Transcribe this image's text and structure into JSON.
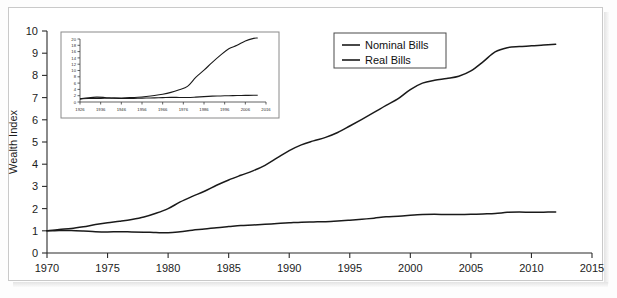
{
  "figure": {
    "background_color": "#ffffff",
    "frame_color": "#c9c9c9",
    "line_color": "#1a1a1a"
  },
  "chart_data": {
    "type": "line",
    "title": "",
    "xlabel": "",
    "ylabel": "Wealth Index",
    "xlim": [
      1970,
      2015
    ],
    "ylim": [
      0,
      10
    ],
    "grid": false,
    "legend_position": "top-right",
    "xticks": [
      1970,
      1975,
      1980,
      1985,
      1990,
      1995,
      2000,
      2005,
      2010,
      2015
    ],
    "yticks": [
      0,
      1,
      2,
      3,
      4,
      5,
      6,
      7,
      8,
      9,
      10
    ],
    "x": [
      1970,
      1971,
      1972,
      1973,
      1974,
      1975,
      1976,
      1977,
      1978,
      1979,
      1980,
      1981,
      1982,
      1983,
      1984,
      1985,
      1986,
      1987,
      1988,
      1989,
      1990,
      1991,
      1992,
      1993,
      1994,
      1995,
      1996,
      1997,
      1998,
      1999,
      2000,
      2001,
      2002,
      2003,
      2004,
      2005,
      2006,
      2007,
      2008,
      2009,
      2010,
      2011,
      2012
    ],
    "series": [
      {
        "name": "Nominal Bills",
        "values": [
          1.0,
          1.06,
          1.1,
          1.18,
          1.28,
          1.36,
          1.43,
          1.51,
          1.62,
          1.79,
          2.0,
          2.3,
          2.55,
          2.78,
          3.05,
          3.29,
          3.5,
          3.7,
          3.95,
          4.28,
          4.61,
          4.87,
          5.05,
          5.21,
          5.43,
          5.72,
          6.02,
          6.33,
          6.65,
          6.95,
          7.36,
          7.65,
          7.78,
          7.86,
          7.96,
          8.2,
          8.61,
          9.06,
          9.25,
          9.3,
          9.33,
          9.37,
          9.4
        ]
      },
      {
        "name": "Real Bills",
        "values": [
          1.0,
          1.01,
          1.01,
          0.99,
          0.96,
          0.95,
          0.96,
          0.95,
          0.94,
          0.92,
          0.91,
          0.96,
          1.03,
          1.08,
          1.14,
          1.19,
          1.24,
          1.26,
          1.29,
          1.33,
          1.36,
          1.39,
          1.4,
          1.41,
          1.44,
          1.48,
          1.52,
          1.57,
          1.63,
          1.66,
          1.7,
          1.73,
          1.74,
          1.73,
          1.73,
          1.74,
          1.76,
          1.78,
          1.83,
          1.85,
          1.83,
          1.84,
          1.85
        ]
      }
    ],
    "inset": {
      "type": "line",
      "xlim": [
        1926,
        2016
      ],
      "ylim": [
        0,
        20
      ],
      "xticks": [
        1926,
        1936,
        1946,
        1956,
        1966,
        1976,
        1986,
        1996,
        2006,
        2016
      ],
      "yticks": [
        0,
        2,
        4,
        6,
        8,
        10,
        12,
        14,
        16,
        18,
        20
      ],
      "x": [
        1926,
        1930,
        1934,
        1938,
        1942,
        1946,
        1950,
        1954,
        1958,
        1962,
        1966,
        1970,
        1974,
        1978,
        1982,
        1986,
        1990,
        1994,
        1998,
        2002,
        2006,
        2010,
        2012
      ],
      "series": [
        {
          "name": "Nominal Bills",
          "values": [
            1.0,
            1.1,
            1.15,
            1.18,
            1.22,
            1.28,
            1.38,
            1.52,
            1.75,
            2.05,
            2.45,
            3.05,
            3.9,
            4.95,
            7.8,
            10.1,
            12.6,
            14.9,
            16.9,
            18.0,
            19.4,
            20.2,
            20.3
          ]
        },
        {
          "name": "Real Bills",
          "values": [
            1.0,
            1.35,
            1.55,
            1.45,
            1.25,
            1.1,
            1.12,
            1.18,
            1.25,
            1.32,
            1.4,
            1.48,
            1.45,
            1.42,
            1.55,
            1.72,
            1.85,
            1.92,
            2.0,
            2.06,
            2.1,
            2.12,
            2.12
          ]
        }
      ]
    }
  },
  "legend": {
    "items": [
      {
        "label": "Nominal Bills"
      },
      {
        "label": "Real Bills"
      }
    ]
  }
}
